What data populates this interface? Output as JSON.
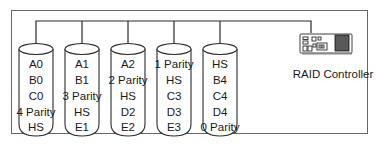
{
  "diagram": {
    "type": "raid-layout",
    "colors": {
      "stroke": "#2a2a2a",
      "frame": "#555555",
      "background": "#ffffff",
      "text": "#1a1a1a"
    },
    "disks": [
      {
        "id": "disk-1",
        "blocks": [
          "A0",
          "B0",
          "C0",
          "4 Parity",
          "HS"
        ]
      },
      {
        "id": "disk-2",
        "blocks": [
          "A1",
          "B1",
          "3 Parity",
          "HS",
          "E1"
        ]
      },
      {
        "id": "disk-3",
        "blocks": [
          "A2",
          "2 Parity",
          "HS",
          "D2",
          "E2"
        ]
      },
      {
        "id": "disk-4",
        "blocks": [
          "1 Parity",
          "HS",
          "C3",
          "D3",
          "E3"
        ]
      },
      {
        "id": "disk-5",
        "blocks": [
          "HS",
          "B4",
          "C4",
          "D4",
          "0 Parity"
        ]
      }
    ],
    "controller": {
      "label": "RAID Controller",
      "icon": "raid-controller-card-icon"
    }
  }
}
